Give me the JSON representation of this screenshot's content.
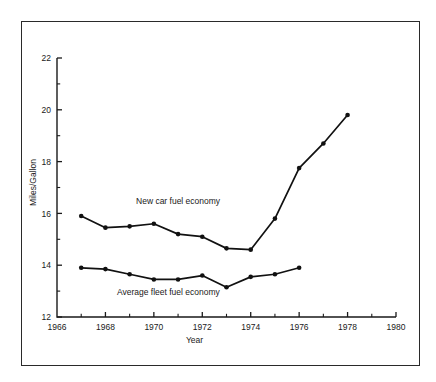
{
  "chart_data": {
    "type": "line",
    "title": "",
    "xlabel": "Year",
    "ylabel": "Miles/Gallon",
    "xlim": [
      1966,
      1980
    ],
    "ylim": [
      12,
      22
    ],
    "xticks": [
      1966,
      1968,
      1970,
      1972,
      1974,
      1976,
      1978,
      1980
    ],
    "xtick_labels": [
      "1966",
      "1968",
      "1970",
      "1972",
      "1974",
      "1976",
      "1978",
      "1980"
    ],
    "xminor_step": 1,
    "yticks": [
      12,
      14,
      16,
      18,
      20,
      22
    ],
    "ytick_labels": [
      "12",
      "14",
      "16",
      "18",
      "20",
      "22"
    ],
    "yminor_step": 1,
    "grid": false,
    "legend_position": "inline-annotation",
    "series": [
      {
        "name": "New car fuel economy",
        "label_x": 1971.0,
        "label_y": 16.35,
        "x": [
          1967,
          1968,
          1969,
          1970,
          1971,
          1972,
          1973,
          1974,
          1975,
          1976,
          1977,
          1978
        ],
        "values": [
          15.9,
          15.45,
          15.5,
          15.6,
          15.2,
          15.1,
          14.65,
          14.6,
          15.8,
          17.75,
          18.7,
          19.8
        ]
      },
      {
        "name": "Average fleet fuel economy",
        "label_x": 1970.6,
        "label_y": 12.85,
        "x": [
          1967,
          1968,
          1969,
          1970,
          1971,
          1972,
          1973,
          1974,
          1975,
          1976
        ],
        "values": [
          13.9,
          13.85,
          13.65,
          13.45,
          13.45,
          13.6,
          13.15,
          13.55,
          13.65,
          13.9
        ]
      }
    ],
    "colors": {
      "line": "#111111",
      "marker": "#111111",
      "axis": "#1a1a1a",
      "frame": "#2a2a2a",
      "background": "#ffffff"
    }
  }
}
